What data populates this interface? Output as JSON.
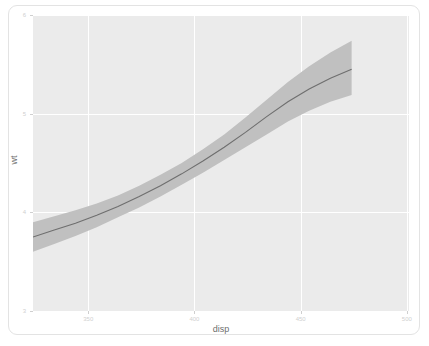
{
  "chart_data": {
    "type": "line",
    "title": "",
    "subtitle": "",
    "xlabel": "disp",
    "ylabel": "wt",
    "xlim": [
      324,
      501
    ],
    "ylim": [
      3,
      6
    ],
    "grid": true,
    "legend": null,
    "x_ticks": [
      350,
      400,
      450,
      500
    ],
    "y_ticks": [
      3,
      4,
      5,
      6
    ],
    "x_tick_labels": [
      "350",
      "400",
      "450",
      "500"
    ],
    "y_tick_labels": [
      "3",
      "4",
      "5",
      "6"
    ],
    "panel_background": "#ebebeb",
    "gridline_color": "#ffffff",
    "ribbon_color": "#c0c0c0",
    "line_color": "#6e6e6e",
    "series": [
      {
        "name": "fit",
        "x": [
          324,
          334,
          344,
          354,
          364,
          374,
          384,
          394,
          404,
          414,
          424,
          434,
          444,
          454,
          464,
          474
        ],
        "values": [
          3.75,
          3.82,
          3.89,
          3.97,
          4.06,
          4.16,
          4.27,
          4.39,
          4.52,
          4.66,
          4.81,
          4.97,
          5.12,
          5.25,
          5.36,
          5.45
        ]
      },
      {
        "name": "ci_upper",
        "x": [
          324,
          334,
          344,
          354,
          364,
          374,
          384,
          394,
          404,
          414,
          424,
          434,
          444,
          454,
          464,
          474
        ],
        "values": [
          3.9,
          3.96,
          4.02,
          4.09,
          4.17,
          4.27,
          4.38,
          4.5,
          4.64,
          4.79,
          4.96,
          5.14,
          5.32,
          5.48,
          5.62,
          5.74
        ]
      },
      {
        "name": "ci_lower",
        "x": [
          324,
          334,
          344,
          354,
          364,
          374,
          384,
          394,
          404,
          414,
          424,
          434,
          444,
          454,
          464,
          474
        ],
        "values": [
          3.6,
          3.68,
          3.76,
          3.85,
          3.95,
          4.05,
          4.16,
          4.28,
          4.4,
          4.53,
          4.66,
          4.79,
          4.92,
          5.03,
          5.12,
          5.19
        ]
      }
    ]
  },
  "axes": {
    "x_title": "disp",
    "y_title": "wt"
  }
}
